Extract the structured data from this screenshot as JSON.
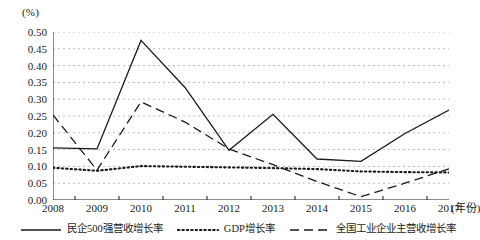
{
  "chart_data": {
    "type": "line",
    "title": "",
    "xlabel": "(年份)",
    "ylabel": "(%)",
    "unit_label": "(%)",
    "x_axis_title": "(年份)",
    "categories": [
      "2008",
      "2009",
      "2010",
      "2011",
      "2012",
      "2013",
      "2014",
      "2015",
      "2016",
      "2017"
    ],
    "x": [
      2008,
      2009,
      2010,
      2011,
      2012,
      2013,
      2014,
      2015,
      2016,
      2017
    ],
    "xlim": [
      2008,
      2017
    ],
    "ylim": [
      0.0,
      0.5
    ],
    "ytick_step": 0.05,
    "ytick_labels": [
      "0.00",
      "0.05",
      "0.10",
      "0.15",
      "0.20",
      "0.25",
      "0.30",
      "0.35",
      "0.40",
      "0.45",
      "0.50"
    ],
    "ytick_values": [
      0.0,
      0.05,
      0.1,
      0.15,
      0.2,
      0.25,
      0.3,
      0.35,
      0.4,
      0.45,
      0.5
    ],
    "grid": true,
    "grid_style": "dotted-horizontal",
    "legend_position": "bottom",
    "series": [
      {
        "name": "民企500强营收增长率",
        "style": "solid",
        "color": "#1a1a1a",
        "values": [
          0.155,
          0.152,
          0.475,
          0.335,
          0.148,
          0.255,
          0.122,
          0.115,
          0.198,
          0.268
        ]
      },
      {
        "name": "GDP增长率",
        "style": "dotted",
        "color": "#1a1a1a",
        "values": [
          0.096,
          0.087,
          0.101,
          0.099,
          0.097,
          0.095,
          0.092,
          0.085,
          0.083,
          0.082
        ]
      },
      {
        "name": "全国工业企业主营收增长率",
        "style": "dashed",
        "color": "#1a1a1a",
        "values": [
          0.253,
          0.089,
          0.292,
          0.232,
          0.152,
          0.105,
          0.055,
          0.01,
          0.05,
          0.093
        ]
      }
    ]
  }
}
